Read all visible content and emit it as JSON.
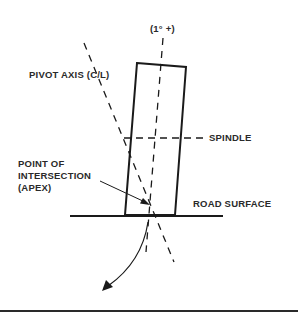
{
  "diagram": {
    "labels": {
      "camber_angle": "(1° +)",
      "pivot_axis": "PIVOT AXIS (C/L)",
      "spindle": "SPINDLE",
      "apex_line1": "POINT OF",
      "apex_line2": "INTERSECTION",
      "apex_line3": "(APEX)",
      "road_surface": "ROAD SURFACE"
    },
    "colors": {
      "line": "#1a1a1a",
      "background": "#ffffff"
    }
  }
}
